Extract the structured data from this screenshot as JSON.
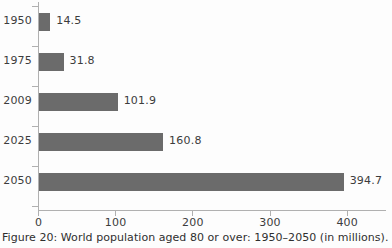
{
  "caption": "Figure 20: World population aged 80 or over: 1950–2050 (in millions).",
  "chart_data": {
    "type": "bar",
    "orientation": "horizontal",
    "title": "",
    "subtitle": "",
    "xlabel": "",
    "ylabel": "",
    "categories": [
      "1950",
      "1975",
      "2009",
      "2025",
      "2050"
    ],
    "values": [
      14.5,
      31.8,
      101.9,
      160.8,
      394.7
    ],
    "value_labels": [
      "14.5",
      "31.8",
      "101.9",
      "160.8",
      "394.7"
    ],
    "series": [
      {
        "name": "World population aged 80 or over (millions)",
        "values": [
          14.5,
          31.8,
          101.9,
          160.8,
          394.7
        ]
      }
    ],
    "xlim": [
      0,
      450
    ],
    "ylim": null,
    "xticks": [
      0,
      100,
      200,
      300,
      400
    ],
    "xtick_labels": [
      "0",
      "100",
      "200",
      "300",
      "400"
    ],
    "grid": false,
    "legend": false,
    "legend_position": "none",
    "bar_color": "#6b6b6b",
    "axis_color": "#b0b0b0",
    "text_color": "#3c3c3c",
    "background_color": "#fdfdfd",
    "units": "millions"
  }
}
